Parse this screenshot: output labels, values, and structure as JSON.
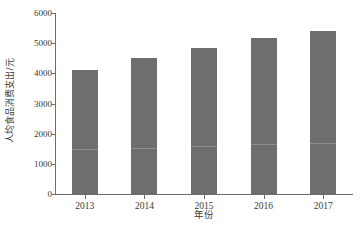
{
  "chart_data": {
    "type": "bar",
    "title": "",
    "xlabel": "年份",
    "ylabel": "人均食品消费支出/元",
    "categories": [
      "2013",
      "2014",
      "2015",
      "2016",
      "2017"
    ],
    "values": [
      4120,
      4500,
      4830,
      5170,
      5400
    ],
    "ylim": [
      0,
      6000
    ],
    "ytick_values": [
      0,
      1000,
      2000,
      3000,
      4000,
      5000,
      6000
    ],
    "ytick_labels": [
      "0",
      "1000",
      "2000",
      "3000",
      "4000",
      "5000",
      "6000"
    ],
    "grid": false,
    "legend": null,
    "bar_color": "#6f6e6e",
    "axis_color": "#6e6e6e",
    "text_color": "#3a3a3a",
    "series": [
      {
        "name": "人均食品消费支出",
        "values": [
          4120,
          4500,
          4830,
          5170,
          5400
        ]
      }
    ],
    "annotations": {
      "bar_seam_value": 1450
    }
  },
  "axes": {
    "y_title": "人均食品消费支出/元",
    "x_title": "年份"
  }
}
